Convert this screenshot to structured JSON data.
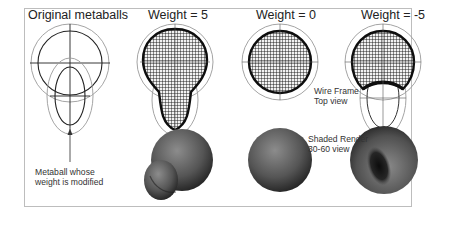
{
  "figure": {
    "columns": [
      {
        "title": "Original metaballs"
      },
      {
        "title": "Weight = 5"
      },
      {
        "title": "Weight = 0"
      },
      {
        "title": "Weight = -5"
      }
    ],
    "annotations": {
      "metaball_label_line1": "Metaball whose",
      "metaball_label_line2": "weight is modified",
      "wireframe_line1": "Wire Frame",
      "wireframe_line2": "Top view",
      "shaded_line1": "Shaded Render",
      "shaded_line2": "30-60 view"
    },
    "colors": {
      "frame": "#bdbdbd",
      "guide": "#9a9a9a",
      "wire": "#1a1a1a",
      "shade_dark": "#1e1e1e",
      "shade_light": "#8a8a8a"
    }
  }
}
